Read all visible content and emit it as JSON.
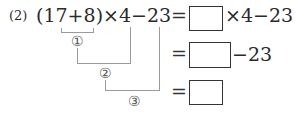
{
  "problem": {
    "label": "(2)",
    "expression": {
      "open_paren": "(",
      "a": "17",
      "plus": "+",
      "b": "8",
      "close_paren": ")",
      "times": "×",
      "c": "4",
      "minus": "−",
      "d": "23"
    },
    "steps": [
      {
        "equals": "=",
        "suffix": "×4−23"
      },
      {
        "equals": "=",
        "suffix": "−23"
      },
      {
        "equals": "=",
        "suffix": ""
      }
    ],
    "step_markers": [
      "①",
      "②",
      "③"
    ]
  }
}
